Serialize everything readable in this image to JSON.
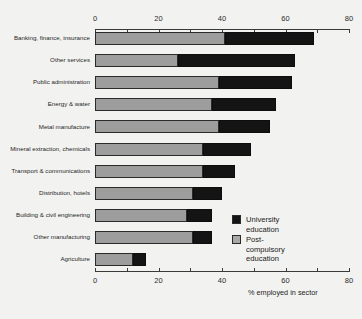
{
  "chart_data": {
    "type": "bar",
    "orientation": "horizontal",
    "stacked": true,
    "title": "",
    "xlabel": "% employed in sector",
    "ylabel": "",
    "xlim": [
      0,
      80
    ],
    "xticks": [
      0,
      20,
      40,
      60,
      80
    ],
    "xtick_labels": [
      "0",
      "20",
      "40",
      "60",
      "80"
    ],
    "minor_tick_interval": 10,
    "grid": false,
    "legend_position": "center-right",
    "categories": [
      "Banking, finance, insurance",
      "Other services",
      "Public administration",
      "Energy & water",
      "Metal manufacture",
      "Mineral extraction, chemicals",
      "Transport & communications",
      "Distribution, hotels",
      "Building & civil engineering",
      "Other manufacturing",
      "Agriculture"
    ],
    "series": [
      {
        "name": "Post-compulsory education",
        "color": "#9d9d9d",
        "values": [
          41,
          26,
          39,
          37,
          39,
          34,
          34,
          31,
          29,
          31,
          12
        ]
      },
      {
        "name": "University education",
        "color": "#141414",
        "values": [
          28,
          37,
          23,
          20,
          16,
          15,
          10,
          9,
          8,
          6,
          4
        ]
      }
    ],
    "totals": [
      69,
      63,
      62,
      57,
      55,
      49,
      44,
      40,
      37,
      37,
      16
    ]
  },
  "legend": {
    "items": [
      {
        "label": "University education",
        "color": "#141414",
        "swatch": "uni"
      },
      {
        "label": "Post-compulsory\neducation",
        "color": "#a8a8a8",
        "swatch": "post"
      }
    ]
  },
  "axis": {
    "x_title": "% employed in sector"
  }
}
